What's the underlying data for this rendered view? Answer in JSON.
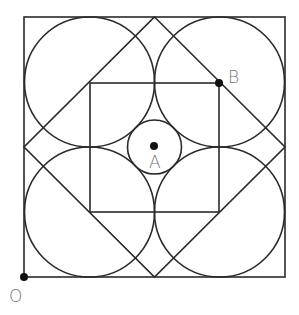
{
  "diagram": {
    "title": "",
    "stroke_color": "#2a2a2a",
    "label_color": "#777777",
    "points": [
      {
        "id": "O",
        "label": "O",
        "x": 24,
        "y": 277
      },
      {
        "id": "A",
        "label": "A",
        "x": 154,
        "y": 147
      },
      {
        "id": "B",
        "label": "B",
        "x": 219,
        "y": 83
      }
    ],
    "outer_square": {
      "x": 24,
      "y": 17,
      "size": 261
    },
    "inner_square": {
      "x": 90,
      "y": 83,
      "size": 129
    },
    "big_circle_radius": 65,
    "small_circle_radius": 27
  }
}
